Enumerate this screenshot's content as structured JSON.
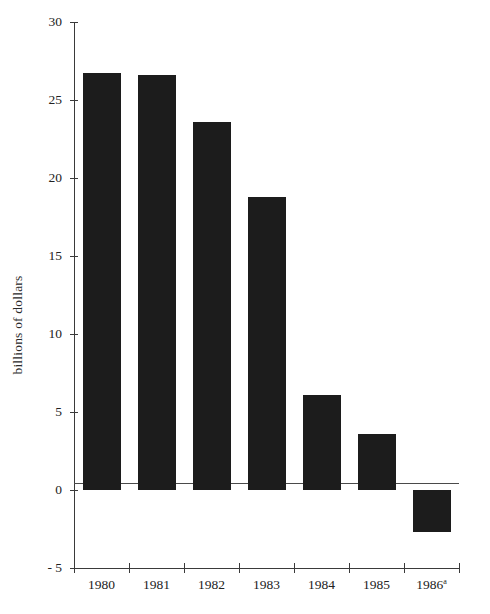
{
  "chart_data": {
    "type": "bar",
    "title": "",
    "subtitle": "",
    "xlabel": "",
    "ylabel": "billions of dollars",
    "categories": [
      "1980",
      "1981",
      "1982",
      "1983",
      "1984",
      "1985",
      "1986"
    ],
    "category_labels": [
      {
        "text": "1980",
        "superscript": ""
      },
      {
        "text": "1981",
        "superscript": ""
      },
      {
        "text": "1982",
        "superscript": ""
      },
      {
        "text": "1983",
        "superscript": ""
      },
      {
        "text": "1984",
        "superscript": ""
      },
      {
        "text": "1985",
        "superscript": ""
      },
      {
        "text": "1986",
        "superscript": "a"
      }
    ],
    "values": [
      26.7,
      26.6,
      23.6,
      18.8,
      6.1,
      3.6,
      -2.7
    ],
    "ylim": [
      -5,
      30
    ],
    "yticks": [
      30,
      25,
      20,
      15,
      10,
      5,
      0,
      -5
    ],
    "ytick_labels": [
      "30",
      "25",
      "20",
      "15",
      "10",
      "5",
      "0",
      "- 5"
    ],
    "grid": false,
    "legend": null,
    "legend_position": "none",
    "bar_color": "#1c1c1c",
    "axis_color": "#3a3a3a",
    "background_color": "#ffffff",
    "zero_line": 0
  }
}
